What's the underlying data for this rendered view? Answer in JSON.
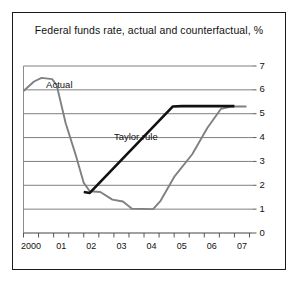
{
  "chart_data": {
    "type": "line",
    "title": "Federal funds rate, actual and counterfactual, %",
    "xlabel": "",
    "ylabel": "",
    "ylim": [
      0,
      7
    ],
    "xlim": [
      2000,
      2007.6
    ],
    "grid": true,
    "legend_position": "inline-annotations",
    "yticks": [
      "0",
      "1",
      "2",
      "3",
      "4",
      "5",
      "6",
      "7"
    ],
    "ytick_values": [
      0,
      1,
      2,
      3,
      4,
      5,
      6,
      7
    ],
    "xticks": [
      "2000",
      "01",
      "02",
      "03",
      "04",
      "05",
      "06",
      "07"
    ],
    "xtick_values": [
      2000,
      2001,
      2002,
      2003,
      2004,
      2005,
      2006,
      2007
    ],
    "annotations": [
      {
        "text": "Actual",
        "x": 2000.75,
        "y": 6.2
      },
      {
        "text": "Taylor rule",
        "x": 2003.0,
        "y": 4.0
      }
    ],
    "series": [
      {
        "name": "Actual",
        "color": "#808080",
        "points": [
          [
            2000.0,
            5.95
          ],
          [
            2000.35,
            6.35
          ],
          [
            2000.6,
            6.5
          ],
          [
            2000.95,
            6.45
          ],
          [
            2001.1,
            6.2
          ],
          [
            2001.4,
            4.6
          ],
          [
            2001.75,
            3.2
          ],
          [
            2002.0,
            2.1
          ],
          [
            2002.2,
            1.75
          ],
          [
            2002.55,
            1.72
          ],
          [
            2002.95,
            1.4
          ],
          [
            2003.3,
            1.32
          ],
          [
            2003.6,
            1.02
          ],
          [
            2004.3,
            1.0
          ],
          [
            2004.55,
            1.35
          ],
          [
            2005.0,
            2.35
          ],
          [
            2005.6,
            3.3
          ],
          [
            2006.1,
            4.4
          ],
          [
            2006.55,
            5.2
          ],
          [
            2006.9,
            5.3
          ],
          [
            2007.4,
            5.3
          ]
        ]
      },
      {
        "name": "Taylor rule",
        "color": "#111111",
        "points": [
          [
            2002.0,
            1.72
          ],
          [
            2002.2,
            1.68
          ],
          [
            2004.95,
            5.3
          ],
          [
            2005.25,
            5.32
          ],
          [
            2007.0,
            5.32
          ]
        ]
      }
    ]
  }
}
